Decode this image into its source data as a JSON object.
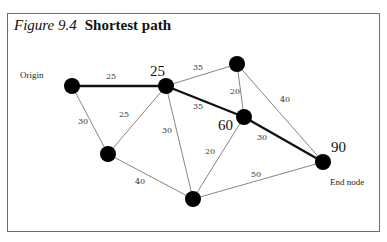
{
  "figure": {
    "number_label": "Figure 9.4",
    "title": "Shortest path"
  },
  "labels": {
    "origin": "Origin",
    "end": "End node"
  },
  "colors": {
    "node": "#000000",
    "edge": "#777777",
    "path_edge": "#111111",
    "frame": "#6e6e6e"
  },
  "nodes": [
    {
      "id": "origin",
      "x": 72,
      "y": 86,
      "cumulative": ""
    },
    {
      "id": "n25",
      "x": 166,
      "y": 86,
      "cumulative": "25"
    },
    {
      "id": "top",
      "x": 237,
      "y": 64,
      "cumulative": ""
    },
    {
      "id": "n60",
      "x": 244,
      "y": 117,
      "cumulative": "60"
    },
    {
      "id": "left",
      "x": 108,
      "y": 154,
      "cumulative": ""
    },
    {
      "id": "bottom",
      "x": 193,
      "y": 199,
      "cumulative": ""
    },
    {
      "id": "end",
      "x": 323,
      "y": 162,
      "cumulative": "90"
    }
  ],
  "edges": [
    {
      "from": "origin",
      "to": "n25",
      "weight": "25",
      "shortest": true
    },
    {
      "from": "origin",
      "to": "left",
      "weight": "30",
      "shortest": false
    },
    {
      "from": "left",
      "to": "n25",
      "weight": "25",
      "shortest": false
    },
    {
      "from": "n25",
      "to": "top",
      "weight": "35",
      "shortest": false
    },
    {
      "from": "n25",
      "to": "n60",
      "weight": "35",
      "shortest": true
    },
    {
      "from": "n25",
      "to": "bottom",
      "weight": "30",
      "shortest": false
    },
    {
      "from": "top",
      "to": "n60",
      "weight": "20",
      "shortest": false
    },
    {
      "from": "top",
      "to": "end",
      "weight": "40",
      "shortest": false
    },
    {
      "from": "n60",
      "to": "end",
      "weight": "30",
      "shortest": true
    },
    {
      "from": "n60",
      "to": "bottom",
      "weight": "20",
      "shortest": false
    },
    {
      "from": "left",
      "to": "bottom",
      "weight": "40",
      "shortest": false
    },
    {
      "from": "bottom",
      "to": "end",
      "weight": "50",
      "shortest": false
    }
  ],
  "edge_labels": {
    "origin_n25": "25",
    "origin_left": "30",
    "left_n25": "25",
    "n25_top": "35",
    "n25_n60": "35",
    "n25_bottom": "30",
    "top_n60": "20",
    "top_end": "40",
    "n60_end": "30",
    "n60_bottom": "20",
    "left_bottom": "40",
    "bottom_end": "50"
  },
  "cumulative": {
    "n25": "25",
    "n60": "60",
    "end": "90"
  }
}
